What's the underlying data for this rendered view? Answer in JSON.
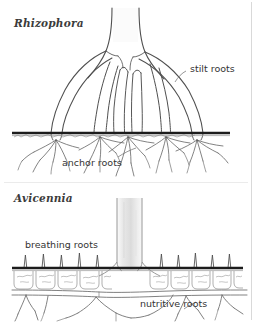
{
  "figure": {
    "name": "mangrove-root-systems-diagram",
    "background_color": "#ffffff",
    "ink_color": "#3b3b3b",
    "ground_line_color": "#1a1a1a",
    "trunk_shade_color": "#e6e6e6",
    "panels": [
      {
        "id": "rhizophora",
        "title": "Rhizophora",
        "labels": [
          {
            "id": "stilt-roots",
            "text": "stilt roots"
          },
          {
            "id": "anchor-roots",
            "text": "anchor roots"
          }
        ]
      },
      {
        "id": "avicennia",
        "title": "Avicennia",
        "labels": [
          {
            "id": "breathing-roots",
            "text": "breathing roots"
          },
          {
            "id": "nutritive-roots",
            "text": "nutritive roots"
          }
        ]
      }
    ]
  },
  "panel_rhizophora": {
    "title": "Rhizophora",
    "stilt_roots_label": "stilt roots",
    "anchor_roots_label": "anchor roots"
  },
  "panel_avicennia": {
    "title": "Avicennia",
    "breathing_roots_label": "breathing roots",
    "nutritive_roots_label": "nutritive roots"
  }
}
